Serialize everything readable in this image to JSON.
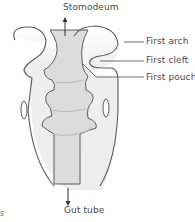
{
  "diagram": {
    "type": "anatomical-schematic",
    "labels": {
      "top": "Stomodeum",
      "bottom": "Gut tube",
      "right": [
        {
          "id": "first-arch",
          "text": "First arch"
        },
        {
          "id": "first-cleft",
          "text": "First cleft"
        },
        {
          "id": "first-pouch",
          "text": "First pouch"
        }
      ],
      "corner_fragment": "s"
    },
    "colors": {
      "outline": "#5a5a5a",
      "body_fill": "#efefef",
      "gut_fill": "#d9d9d9",
      "text": "#4a4a4a",
      "leader_line": "#6a6a6a"
    }
  }
}
